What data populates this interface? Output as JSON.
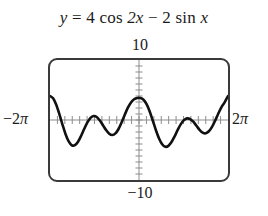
{
  "title": {
    "full": "y = 4 cos 2x - 2 sin x",
    "lhs": "y",
    "eq": "=",
    "term1_coef": "4",
    "term1_fn": "cos",
    "term1_arg": "2x",
    "minus": "−",
    "term2_coef": "2",
    "term2_fn": "sin",
    "term2_arg": "x"
  },
  "window": {
    "ymax_label": "10",
    "ymin_label": "−10",
    "xmin_label": "−2π",
    "xmax_label": "2π",
    "xmin_label_num": "−2",
    "xmin_label_pi": "π",
    "xmax_label_num": "2",
    "xmax_label_pi": "π"
  },
  "colors": {
    "curve": "#111111",
    "frame": "#3a3a3a",
    "axis": "#8d8d8d",
    "text": "#1b1b1b",
    "background": "#ffffff"
  },
  "chart_data": {
    "type": "line",
    "title": "y = 4 cos 2x − 2 sin x",
    "xlabel": "",
    "ylabel": "",
    "xlim": [
      -6.283185307,
      6.283185307
    ],
    "ylim": [
      -10,
      10
    ],
    "xtick_labels": [
      "−2π",
      "2π"
    ],
    "ytick_labels": [
      "10",
      "−10"
    ],
    "grid": false,
    "legend": null,
    "expression": "4*cos(2*x) - 2*sin(x)",
    "x_axis_ticks_interval": 0.5235987756,
    "y_axis_ticks_interval": 1,
    "series": [
      {
        "name": "y = 4 cos 2x − 2 sin x",
        "x": [
          -6.2832,
          -6.0632,
          -5.8433,
          -5.6233,
          -5.4034,
          -5.1834,
          -4.9635,
          -4.7435,
          -4.5236,
          -4.3036,
          -4.0837,
          -3.8637,
          -3.6438,
          -3.4238,
          -3.2039,
          -2.9839,
          -2.764,
          -2.544,
          -2.3241,
          -2.1041,
          -1.8842,
          -1.6642,
          -1.4443,
          -1.2243,
          -1.0044,
          -0.7844,
          -0.5645,
          -0.3445,
          -0.1246,
          0.0954,
          0.3153,
          0.5353,
          0.7552,
          0.9752,
          1.1951,
          1.4151,
          1.635,
          1.855,
          2.0749,
          2.2949,
          2.5148,
          2.7348,
          2.9547,
          3.1747,
          3.3946,
          3.6146,
          3.8345,
          4.0545,
          4.2744,
          4.4944,
          4.7143,
          4.9343,
          5.1542,
          5.3742,
          5.5941,
          5.8141,
          6.034,
          6.2832
        ],
        "y": [
          4.0,
          3.61,
          2.53,
          0.97,
          -0.76,
          -2.37,
          -3.58,
          -4.21,
          -4.2,
          -3.62,
          -2.63,
          -1.47,
          -0.4,
          0.36,
          0.67,
          0.5,
          -0.07,
          -0.87,
          -1.68,
          -2.29,
          -2.51,
          -2.24,
          -1.5,
          -0.38,
          0.88,
          2.05,
          2.93,
          3.46,
          3.67,
          3.65,
          3.38,
          2.64,
          1.42,
          -0.12,
          -1.7,
          -3.08,
          -4.04,
          -4.46,
          -4.31,
          -3.68,
          -2.72,
          -1.65,
          -0.69,
          -0.02,
          0.27,
          0.16,
          -0.29,
          -0.96,
          -1.63,
          -2.1,
          -2.21,
          -1.88,
          -1.15,
          -0.11,
          1.04,
          2.1,
          2.91,
          4.0
        ]
      }
    ],
    "features": {
      "peaks_y_approx": [
        4.0,
        0.67,
        3.67,
        0.27,
        4.0
      ],
      "troughs_y_approx": [
        -4.21,
        -2.51,
        -4.46,
        -2.21
      ]
    }
  }
}
